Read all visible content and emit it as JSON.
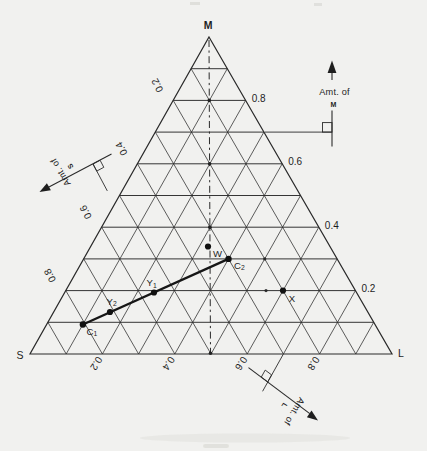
{
  "triangle": {
    "top_vertex": "M",
    "left_vertex": "S",
    "right_vertex": "L"
  },
  "axes": {
    "m": {
      "amount_label": "Amt. of",
      "component": "M",
      "ticks": [
        "0.8",
        "0.6",
        "0.4",
        "0.2"
      ]
    },
    "s": {
      "amount_label": "Amt. of",
      "component": "S",
      "ticks": [
        "0.2",
        "0.4",
        "0.6",
        "0.8"
      ]
    },
    "l": {
      "amount_label": "Amt. of",
      "component": "L",
      "ticks": [
        "0.2",
        "0.4",
        "0.6",
        "0.8"
      ]
    }
  },
  "points": {
    "w": {
      "base": "W",
      "sub": ""
    },
    "c2": {
      "base": "C",
      "sub": "2"
    },
    "y1": {
      "base": "Y",
      "sub": "1"
    },
    "y2": {
      "base": "Y",
      "sub": "2"
    },
    "c1": {
      "base": "C",
      "sub": "1"
    },
    "x": {
      "base": "X",
      "sub": ""
    }
  },
  "colors": {
    "ink": "#2a2a2a",
    "paper": "#f1f1ef",
    "tie_line": "#161616"
  },
  "chart_data": {
    "type": "ternary",
    "components": [
      "M",
      "S",
      "L"
    ],
    "vertex_labels": {
      "top": "M",
      "bottom_left": "S",
      "bottom_right": "L"
    },
    "grid_interval": 0.1,
    "axis_tick_labels": {
      "M_right_side": [
        0.8,
        0.6,
        0.4,
        0.2
      ],
      "S_left_side": [
        0.2,
        0.4,
        0.6,
        0.8
      ],
      "L_bottom": [
        0.2,
        0.4,
        0.6,
        0.8
      ]
    },
    "points": [
      {
        "label": "W",
        "M": 0.33,
        "S": 0.33,
        "L": 0.33,
        "note": "on dash-dot median line"
      },
      {
        "label": "C2",
        "M": 0.3,
        "S": 0.3,
        "L": 0.4
      },
      {
        "label": "Y1",
        "M": 0.19,
        "S": 0.56,
        "L": 0.25
      },
      {
        "label": "Y2",
        "M": 0.13,
        "S": 0.71,
        "L": 0.16
      },
      {
        "label": "C1",
        "M": 0.1,
        "S": 0.8,
        "L": 0.1
      },
      {
        "label": "X",
        "M": 0.2,
        "S": 0.2,
        "L": 0.6
      }
    ],
    "tie_line": {
      "from": "C1",
      "through": [
        "Y2",
        "Y1"
      ],
      "to": "C2"
    },
    "median_line": {
      "style": "dash-dot",
      "from": "M vertex",
      "to": "midpoint of S-L edge"
    },
    "axis_arrows": [
      {
        "label": "Amt. of M",
        "direction": "up"
      },
      {
        "label": "Amt. of S",
        "direction": "lower-left"
      },
      {
        "label": "Amt. of L",
        "direction": "lower-right"
      }
    ]
  }
}
